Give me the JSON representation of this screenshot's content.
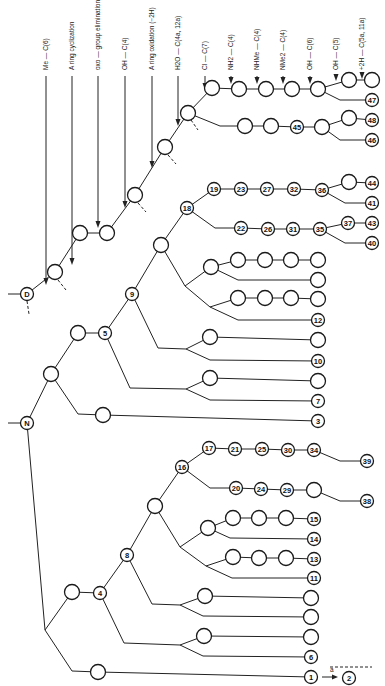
{
  "diagram": {
    "transformations": [
      {
        "id": "t1",
        "label": "Me — C(6)",
        "x": 46,
        "y1": 8,
        "y2": 285
      },
      {
        "id": "t2",
        "label": "A ring  cyclization",
        "x": 72,
        "y1": 8,
        "y2": 265
      },
      {
        "id": "t3",
        "label": "oxo — group  elimination — C(8) (+2H, −H2O)",
        "x": 98,
        "y1": 8,
        "y2": 228
      },
      {
        "id": "t4",
        "label": "OH — C(4)",
        "x": 125,
        "y1": 8,
        "y2": 208
      },
      {
        "id": "t5",
        "label": "A ring  oxidation  (−2H)",
        "x": 152,
        "y1": 8,
        "y2": 168
      },
      {
        "id": "t6",
        "label": "H2O — C(4a, 12a)",
        "x": 178,
        "y1": 8,
        "y2": 126
      },
      {
        "id": "t7",
        "label": "Cl — C(7)",
        "x": 205,
        "y1": 8,
        "y2": 90
      },
      {
        "id": "t8",
        "label": "NH2 — C(4)",
        "x": 231,
        "y1": 8,
        "y2": 84
      },
      {
        "id": "t9",
        "label": "NHMe — C(4)",
        "x": 257,
        "y1": 8,
        "y2": 84
      },
      {
        "id": "t10",
        "label": "NMe2 — C(4)",
        "x": 283,
        "y1": 8,
        "y2": 84
      },
      {
        "id": "t11",
        "label": "OH — C(6)",
        "x": 310,
        "y1": 8,
        "y2": 84
      },
      {
        "id": "t12",
        "label": "OH — C(5)",
        "x": 336,
        "y1": 8,
        "y2": 81
      },
      {
        "id": "t13",
        "label": "+2H — C(5a, 11a)",
        "x": 362,
        "y1": 8,
        "y2": 79
      }
    ],
    "nodes": [
      {
        "id": "D",
        "label": "D",
        "x": 27,
        "y": 294
      },
      {
        "id": "N",
        "label": "N",
        "x": 27,
        "y": 423
      },
      {
        "id": "a1",
        "label": "",
        "x": 55,
        "y": 272
      },
      {
        "id": "a2",
        "label": "",
        "x": 80,
        "y": 233
      },
      {
        "id": "a3",
        "label": "",
        "x": 107,
        "y": 233
      },
      {
        "id": "a4",
        "label": "",
        "x": 135,
        "y": 195
      },
      {
        "id": "a5",
        "label": "",
        "x": 165,
        "y": 147
      },
      {
        "id": "a6",
        "label": "",
        "x": 188,
        "y": 113
      },
      {
        "id": "b1",
        "label": "",
        "x": 212,
        "y": 88
      },
      {
        "id": "b2",
        "label": "",
        "x": 239,
        "y": 89
      },
      {
        "id": "b3",
        "label": "",
        "x": 266,
        "y": 89
      },
      {
        "id": "b4",
        "label": "",
        "x": 292,
        "y": 89
      },
      {
        "id": "b5",
        "label": "",
        "x": 318,
        "y": 89
      },
      {
        "id": "b6",
        "label": "",
        "x": 349,
        "y": 80
      },
      {
        "id": "b7",
        "label": "",
        "x": 372,
        "y": 80
      },
      {
        "id": "n47",
        "label": "47",
        "x": 372,
        "y": 100
      },
      {
        "id": "c1",
        "label": "",
        "x": 245,
        "y": 126
      },
      {
        "id": "c2",
        "label": "",
        "x": 271,
        "y": 126
      },
      {
        "id": "n45",
        "label": "45",
        "x": 297,
        "y": 127
      },
      {
        "id": "c4",
        "label": "",
        "x": 322,
        "y": 127
      },
      {
        "id": "c5",
        "label": "",
        "x": 349,
        "y": 118
      },
      {
        "id": "n48",
        "label": "48",
        "x": 372,
        "y": 120
      },
      {
        "id": "n46",
        "label": "46",
        "x": 372,
        "y": 140
      },
      {
        "id": "n5",
        "label": "5",
        "x": 105,
        "y": 333
      },
      {
        "id": "e1",
        "label": "",
        "x": 78,
        "y": 333
      },
      {
        "id": "e2",
        "label": "",
        "x": 51,
        "y": 374
      },
      {
        "id": "n9",
        "label": "9",
        "x": 132,
        "y": 294
      },
      {
        "id": "f1",
        "label": "",
        "x": 161,
        "y": 245
      },
      {
        "id": "n18",
        "label": "18",
        "x": 187,
        "y": 208
      },
      {
        "id": "n19",
        "label": "19",
        "x": 214,
        "y": 189
      },
      {
        "id": "n23",
        "label": "23",
        "x": 241,
        "y": 189
      },
      {
        "id": "n27",
        "label": "27",
        "x": 267,
        "y": 189
      },
      {
        "id": "n32",
        "label": "32",
        "x": 294,
        "y": 189
      },
      {
        "id": "n36",
        "label": "36",
        "x": 322,
        "y": 190
      },
      {
        "id": "g1",
        "label": "",
        "x": 349,
        "y": 182
      },
      {
        "id": "n44",
        "label": "44",
        "x": 372,
        "y": 183
      },
      {
        "id": "n41",
        "label": "41",
        "x": 372,
        "y": 203
      },
      {
        "id": "n22",
        "label": "22",
        "x": 241,
        "y": 228
      },
      {
        "id": "n26",
        "label": "26",
        "x": 268,
        "y": 229
      },
      {
        "id": "n31",
        "label": "31",
        "x": 293,
        "y": 229
      },
      {
        "id": "n35",
        "label": "35",
        "x": 320,
        "y": 229
      },
      {
        "id": "n37",
        "label": "37",
        "x": 348,
        "y": 223
      },
      {
        "id": "n43",
        "label": "43",
        "x": 372,
        "y": 223
      },
      {
        "id": "n40",
        "label": "40",
        "x": 372,
        "y": 243
      },
      {
        "id": "h1",
        "label": "",
        "x": 211,
        "y": 267
      },
      {
        "id": "h2",
        "label": "",
        "x": 238,
        "y": 260
      },
      {
        "id": "h3",
        "label": "",
        "x": 265,
        "y": 260
      },
      {
        "id": "h4",
        "label": "",
        "x": 291,
        "y": 260
      },
      {
        "id": "h5",
        "label": "",
        "x": 318,
        "y": 260
      },
      {
        "id": "h6",
        "label": "",
        "x": 318,
        "y": 280
      },
      {
        "id": "i1",
        "label": "",
        "x": 238,
        "y": 298
      },
      {
        "id": "i2",
        "label": "",
        "x": 265,
        "y": 298
      },
      {
        "id": "i3",
        "label": "",
        "x": 291,
        "y": 298
      },
      {
        "id": "i4",
        "label": "",
        "x": 318,
        "y": 299
      },
      {
        "id": "n12",
        "label": "12",
        "x": 318,
        "y": 320
      },
      {
        "id": "j1",
        "label": "",
        "x": 210,
        "y": 337
      },
      {
        "id": "j2",
        "label": "",
        "x": 318,
        "y": 340
      },
      {
        "id": "n10",
        "label": "10",
        "x": 318,
        "y": 361
      },
      {
        "id": "k1",
        "label": "",
        "x": 210,
        "y": 378
      },
      {
        "id": "k2",
        "label": "",
        "x": 318,
        "y": 381
      },
      {
        "id": "n7",
        "label": "7",
        "x": 318,
        "y": 401
      },
      {
        "id": "m1",
        "label": "",
        "x": 103,
        "y": 415
      },
      {
        "id": "n3",
        "label": "3",
        "x": 318,
        "y": 421
      },
      {
        "id": "n16",
        "label": "16",
        "x": 182,
        "y": 467
      },
      {
        "id": "n17",
        "label": "17",
        "x": 209,
        "y": 448
      },
      {
        "id": "n21",
        "label": "21",
        "x": 235,
        "y": 449
      },
      {
        "id": "n25",
        "label": "25",
        "x": 262,
        "y": 449
      },
      {
        "id": "n30",
        "label": "30",
        "x": 288,
        "y": 450
      },
      {
        "id": "n34",
        "label": "34",
        "x": 314,
        "y": 450
      },
      {
        "id": "n39",
        "label": "39",
        "x": 367,
        "y": 461
      },
      {
        "id": "n20",
        "label": "20",
        "x": 236,
        "y": 488
      },
      {
        "id": "n24",
        "label": "24",
        "x": 261,
        "y": 489
      },
      {
        "id": "n29",
        "label": "29",
        "x": 287,
        "y": 490
      },
      {
        "id": "p1",
        "label": "",
        "x": 314,
        "y": 490
      },
      {
        "id": "n38",
        "label": "38",
        "x": 367,
        "y": 501
      },
      {
        "id": "q1",
        "label": "",
        "x": 155,
        "y": 506
      },
      {
        "id": "n8",
        "label": "8",
        "x": 127,
        "y": 555
      },
      {
        "id": "n4",
        "label": "4",
        "x": 100,
        "y": 593
      },
      {
        "id": "r1",
        "label": "",
        "x": 72,
        "y": 592
      },
      {
        "id": "s1",
        "label": "",
        "x": 208,
        "y": 528
      },
      {
        "id": "s2",
        "label": "",
        "x": 233,
        "y": 518
      },
      {
        "id": "s3",
        "label": "",
        "x": 259,
        "y": 518
      },
      {
        "id": "s4",
        "label": "",
        "x": 286,
        "y": 518
      },
      {
        "id": "n15",
        "label": "15",
        "x": 314,
        "y": 519
      },
      {
        "id": "n14",
        "label": "14",
        "x": 314,
        "y": 539
      },
      {
        "id": "u1",
        "label": "",
        "x": 233,
        "y": 557
      },
      {
        "id": "u2",
        "label": "",
        "x": 259,
        "y": 558
      },
      {
        "id": "u3",
        "label": "",
        "x": 286,
        "y": 558
      },
      {
        "id": "n13",
        "label": "13",
        "x": 314,
        "y": 559
      },
      {
        "id": "n11",
        "label": "11",
        "x": 314,
        "y": 578
      },
      {
        "id": "v1",
        "label": "",
        "x": 205,
        "y": 596
      },
      {
        "id": "v2",
        "label": "",
        "x": 311,
        "y": 598
      },
      {
        "id": "v3",
        "label": "",
        "x": 311,
        "y": 617
      },
      {
        "id": "w1",
        "label": "",
        "x": 204,
        "y": 636
      },
      {
        "id": "w2",
        "label": "",
        "x": 311,
        "y": 637
      },
      {
        "id": "n6",
        "label": "6",
        "x": 311,
        "y": 657
      },
      {
        "id": "x1",
        "label": "",
        "x": 98,
        "y": 672
      },
      {
        "id": "n1",
        "label": "1",
        "x": 311,
        "y": 677
      },
      {
        "id": "n2",
        "label": "2",
        "x": 349,
        "y": 678
      }
    ],
    "arrow_label": "a",
    "roots": [
      "D",
      "N"
    ]
  }
}
